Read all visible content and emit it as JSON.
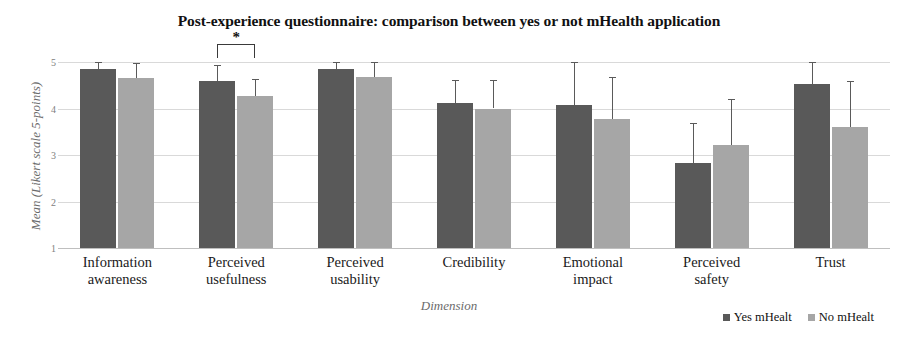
{
  "chart_data": {
    "type": "bar",
    "title": "Post-experience questionnaire: comparison between yes or not mHealth application",
    "xlabel": "Dimension",
    "ylabel": "Mean (Likert scale 5-points)",
    "ylim": [
      1,
      5
    ],
    "yticks": [
      1,
      2,
      3,
      4,
      5
    ],
    "grid": true,
    "legend_position": "bottom-right",
    "categories": [
      "Information awareness",
      "Perceived usefulness",
      "Perceived usability",
      "Credibility",
      "Emotional impact",
      "Perceived safety",
      "Trust"
    ],
    "category_lines": [
      [
        "Information",
        "awareness"
      ],
      [
        "Perceived",
        "usefulness"
      ],
      [
        "Perceived",
        "usability"
      ],
      [
        "Credibility",
        ""
      ],
      [
        "Emotional",
        "impact"
      ],
      [
        "Perceived",
        "safety"
      ],
      [
        "Trust",
        ""
      ]
    ],
    "series": [
      {
        "name": "Yes mHealt",
        "color": "#595959",
        "values": [
          4.86,
          4.6,
          4.84,
          4.11,
          4.07,
          2.83,
          4.52
        ],
        "errors": [
          0.16,
          0.33,
          0.15,
          0.5,
          0.93,
          0.86,
          0.48
        ]
      },
      {
        "name": "No mHealt",
        "color": "#a6a6a6",
        "values": [
          4.65,
          4.27,
          4.67,
          4.0,
          3.78,
          3.22,
          3.6
        ],
        "errors": [
          0.33,
          0.37,
          0.32,
          0.62,
          0.89,
          0.98,
          1.0
        ]
      }
    ],
    "annotations": [
      {
        "type": "significance-bracket",
        "label": "*",
        "category": "Perceived usefulness",
        "between": [
          "Yes mHealt",
          "No mHealt"
        ]
      }
    ]
  },
  "legend": {
    "items": [
      {
        "label": "Yes mHealt",
        "color": "#595959"
      },
      {
        "label": "No mHealt",
        "color": "#a6a6a6"
      }
    ]
  }
}
